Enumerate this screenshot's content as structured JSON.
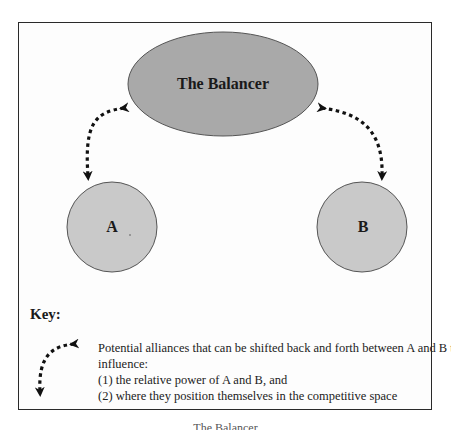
{
  "diagram": {
    "nodes": {
      "balancer": {
        "label": "The Balancer",
        "shape": "ellipse",
        "fill": "#a9a9a9"
      },
      "a": {
        "label": "A",
        "shape": "circle",
        "fill": "#c9c9c9"
      },
      "b": {
        "label": "B",
        "shape": "circle",
        "fill": "#c9c9c9"
      }
    },
    "edges": [
      {
        "from": "balancer",
        "to": "a",
        "style": "dotted",
        "direction": "bidirectional"
      },
      {
        "from": "balancer",
        "to": "b",
        "style": "dotted",
        "direction": "bidirectional"
      }
    ],
    "key": {
      "title": "Key:",
      "symbol": "dotted-bidirectional-arrow",
      "lines": [
        "Potential alliances that can be shifted back and forth between A and B to",
        "influence:",
        "(1) the relative power of A and B, and",
        "(2) where they position themselves in the competitive space"
      ]
    },
    "caption": "The Balancer",
    "colors": {
      "frame": "#2a2a2a",
      "ellipse_fill": "#a9a9a9",
      "circle_fill": "#c9c9c9",
      "outline": "#444444",
      "arrow": "#111111"
    }
  }
}
